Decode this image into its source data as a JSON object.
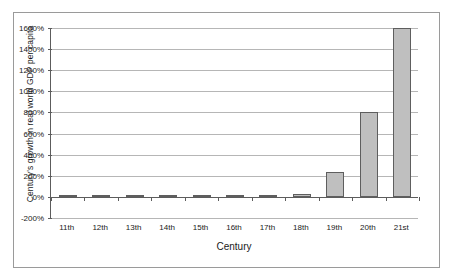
{
  "chart_data": {
    "type": "bar",
    "title": "",
    "xlabel": "Century",
    "ylabel": "Century's growth in real world GDP per capita",
    "categories": [
      "11th",
      "12th",
      "13th",
      "14th",
      "15th",
      "16th",
      "17th",
      "18th",
      "19th",
      "20th",
      "21st"
    ],
    "values": [
      5,
      5,
      5,
      20,
      5,
      5,
      5,
      25,
      240,
      800,
      1600
    ],
    "value_labels": [
      "5%",
      "5%",
      "5%",
      "20%",
      "5%",
      "5%",
      "5%",
      "25%",
      "240%",
      "800%",
      "1600%"
    ],
    "ylim": [
      -200,
      1600
    ],
    "ytick_values": [
      -200,
      0,
      200,
      400,
      600,
      800,
      1000,
      1200,
      1400,
      1600
    ],
    "ytick_labels": [
      "-200%",
      "0%",
      "200%",
      "400%",
      "600%",
      "800%",
      "1000%",
      "1200%",
      "1400%",
      "1600%"
    ],
    "grid": true,
    "legend": "none",
    "units": "percent",
    "series": [
      {
        "name": "Century's growth in real world GDP per capita",
        "values": [
          5,
          5,
          5,
          20,
          5,
          5,
          5,
          25,
          240,
          800,
          1600
        ]
      }
    ]
  },
  "colors": {
    "bar_fill": "#bfbfbf",
    "bar_border": "#5e5e5e",
    "gridline": "#b6b6b6",
    "axis_line": "#5c5c5c",
    "frame_border": "#9a9a9a",
    "text": "#1a1a1a",
    "background": "#ffffff"
  }
}
